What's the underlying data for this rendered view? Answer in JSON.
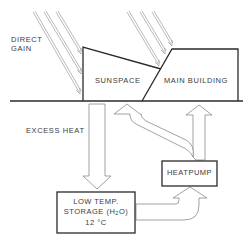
{
  "diagram": {
    "labels": {
      "direct_gain_line1": "DIRECT",
      "direct_gain_line2": "GAIN",
      "sunspace": "SUNSPACE",
      "main_building": "MAIN BUILDING",
      "excess_heat": "EXCESS HEAT",
      "heatpump": "HEATPUMP",
      "storage_line1": "LOW TEMP.",
      "storage_line2_prefix": "STORAGE (H",
      "storage_line2_sub": "2",
      "storage_line2_suffix": "O)",
      "storage_line3": "12 °C"
    },
    "nodes": [
      "Sunspace",
      "Main Building",
      "Low Temp. Storage (H2O) 12 °C",
      "Heatpump"
    ],
    "edges": [
      {
        "from": "Sun",
        "to": "Sunspace",
        "label": "Direct Gain"
      },
      {
        "from": "Sun",
        "to": "Main Building",
        "label": ""
      },
      {
        "from": "Sunspace",
        "to": "Low Temp. Storage (H2O) 12 °C",
        "label": "Excess Heat"
      },
      {
        "from": "Low Temp. Storage (H2O) 12 °C",
        "to": "Heatpump",
        "label": ""
      },
      {
        "from": "Heatpump",
        "to": "Sunspace",
        "label": ""
      },
      {
        "from": "Heatpump",
        "to": "Main Building",
        "label": ""
      }
    ],
    "colors": {
      "line": "#2a2a2a",
      "arrow_outline": "#8a8a8a",
      "text": "#3a3a3a",
      "background": "#ffffff"
    }
  }
}
